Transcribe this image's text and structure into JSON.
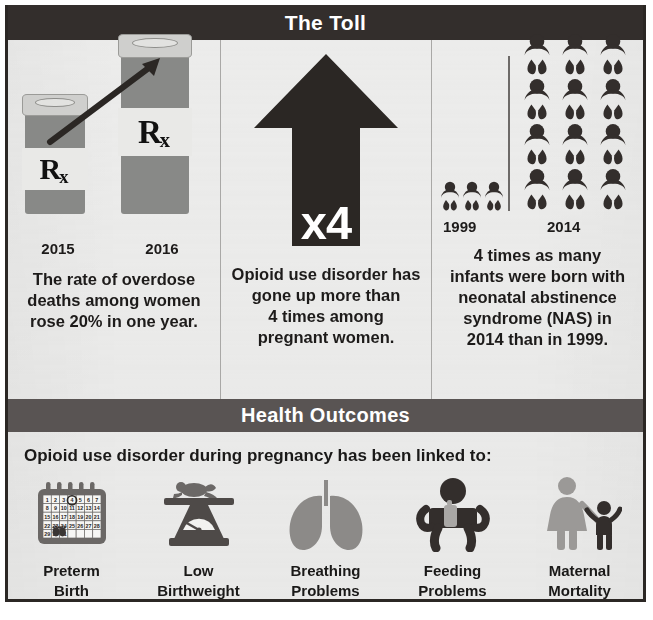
{
  "sections": {
    "toll": {
      "title": "The Toll"
    },
    "outcomes": {
      "title": "Health Outcomes",
      "lede": "Opioid use disorder during pregnancy has been linked to:"
    }
  },
  "toll_panels": [
    {
      "id": "overdose-deaths",
      "icon": "pill-bottles-rising-arrow",
      "rx_label": "Rx",
      "year_start": "2015",
      "year_end": "2016",
      "caption_lines": [
        "The rate of overdose",
        "deaths among women",
        "rose 20% in one year."
      ]
    },
    {
      "id": "opioid-use-disorder",
      "icon": "up-arrow",
      "multiplier": "x4",
      "caption_lines": [
        "Opioid use disorder has",
        "gone up more than",
        "4 times among",
        "pregnant women."
      ]
    },
    {
      "id": "neonatal-abstinence-syndrome",
      "icon": "baby-pictogram",
      "year_start": "1999",
      "year_end": "2014",
      "babies_1999": 3,
      "babies_2014": 12,
      "caption_lines": [
        "4 times as many",
        "infants were born with",
        "neonatal abstinence",
        "syndrome (NAS) in",
        "2014 than in 1999."
      ]
    }
  ],
  "outcomes_items": [
    {
      "icon": "calendar-icon",
      "label_line1": "Preterm",
      "label_line2": "Birth"
    },
    {
      "icon": "scale-icon",
      "label_line1": "Low",
      "label_line2": "Birthweight"
    },
    {
      "icon": "lungs-icon",
      "label_line1": "Breathing",
      "label_line2": "Problems"
    },
    {
      "icon": "baby-bottle-icon",
      "label_line1": "Feeding",
      "label_line2": "Problems"
    },
    {
      "icon": "mother-child-icon",
      "label_line1": "Maternal",
      "label_line2": "Mortality"
    }
  ],
  "calendar": {
    "weeks": [
      [
        "1",
        "2",
        "3",
        "4",
        "5",
        "6",
        "7"
      ],
      [
        "8",
        "9",
        "10",
        "11",
        "12",
        "13",
        "14"
      ],
      [
        "15",
        "16",
        "17",
        "18",
        "19",
        "20",
        "21"
      ],
      [
        "22",
        "23",
        "24",
        "25",
        "26",
        "27",
        "28"
      ],
      [
        "29",
        "30",
        "31",
        "",
        "",
        "",
        ""
      ]
    ],
    "circled_day": "5"
  },
  "colors": {
    "toll_bar": "#332e2c",
    "outcomes_bar": "#595453",
    "paper": "#ececeb",
    "dark_ink": "#332e2c",
    "mid_gray": "#888987",
    "light_gray": "#cfcfcd"
  }
}
